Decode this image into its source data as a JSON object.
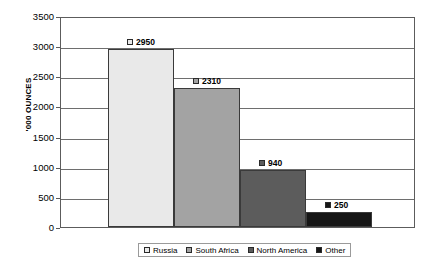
{
  "chart_data": {
    "type": "bar",
    "title": "",
    "xlabel": "",
    "ylabel": "'000 OUNCES",
    "categories": [
      "Russia",
      "South Africa",
      "North America",
      "Other"
    ],
    "values": [
      2950,
      2310,
      940,
      250
    ],
    "data_labels": [
      "2950",
      "2310",
      "940",
      "250"
    ],
    "series": [
      {
        "name": "Platinum production",
        "values": [
          2950,
          2310,
          940,
          250
        ]
      }
    ],
    "ylim": [
      0,
      3500
    ],
    "ytick_step": 500,
    "yticks": [
      3500,
      3000,
      2500,
      2000,
      1500,
      1000,
      500,
      0
    ],
    "ytick_labels": [
      "3500",
      "3000",
      "2500",
      "2000",
      "1500",
      "1000",
      "500",
      "0"
    ],
    "grid": true,
    "grid_axis": "y",
    "legend_position": "bottom",
    "legend_entries": [
      {
        "label": "Russia",
        "color": "#e9e9e9"
      },
      {
        "label": "South Africa",
        "color": "#a3a3a3"
      },
      {
        "label": "North America",
        "color": "#5c5c5c"
      },
      {
        "label": "Other",
        "color": "#161616"
      }
    ],
    "colors": [
      "#e9e9e9",
      "#a3a3a3",
      "#5c5c5c",
      "#161616"
    ]
  }
}
